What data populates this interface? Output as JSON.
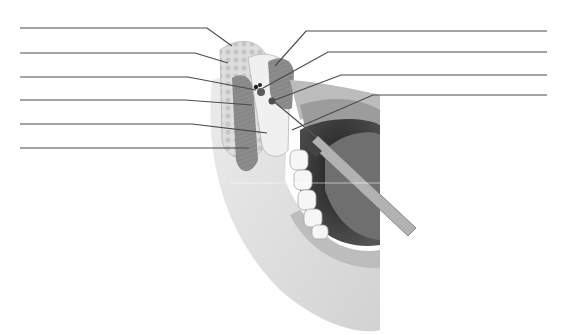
{
  "diagram": {
    "title": "",
    "colors": {
      "background": "#ffffff",
      "leader_line": "#4a4a4a",
      "skin": "#e6e6e6",
      "skin_shadow": "#cfcfcf",
      "muscle": "#8f8f8f",
      "fat": "#d9d9d9",
      "bone": "#f2f2f2",
      "mouth_dark": "#2e2e2e",
      "tongue": "#6e6e6e",
      "teeth": "#f7f7f7",
      "needle": "#9a9a9a"
    },
    "left_labels": [
      {
        "id": "L1",
        "text": "",
        "y": 28
      },
      {
        "id": "L2",
        "text": "",
        "y": 53
      },
      {
        "id": "L3",
        "text": "",
        "y": 77
      },
      {
        "id": "L4",
        "text": "",
        "y": 100
      },
      {
        "id": "L5",
        "text": "",
        "y": 124
      },
      {
        "id": "L6",
        "text": "",
        "y": 148
      }
    ],
    "right_labels": [
      {
        "id": "R1",
        "text": "",
        "y": 31
      },
      {
        "id": "R2",
        "text": "",
        "y": 52
      },
      {
        "id": "R3",
        "text": "",
        "y": 75
      },
      {
        "id": "R4",
        "text": "",
        "y": 95
      }
    ]
  }
}
